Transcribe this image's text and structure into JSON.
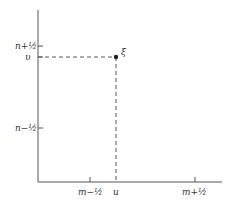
{
  "diagram": {
    "y_axis": {
      "ticks": [
        {
          "label": "n+½",
          "y": 46
        },
        {
          "label": "n−½",
          "y": 128
        }
      ],
      "point_label": "υ"
    },
    "x_axis": {
      "ticks": [
        {
          "label": "m−½",
          "x": 97
        },
        {
          "label": "m+½",
          "x": 202
        }
      ],
      "point_label": "u"
    },
    "point": {
      "label": "ξ",
      "x": 116,
      "y": 57
    },
    "colors": {
      "axis": "#555555",
      "dashed": "#555555",
      "point": "#222222"
    }
  }
}
